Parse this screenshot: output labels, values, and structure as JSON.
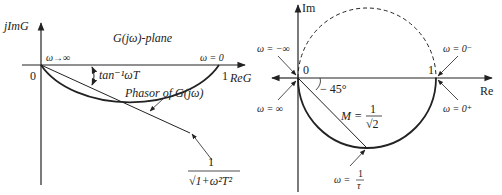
{
  "left_plot": {
    "y_axis_label": "jImG",
    "x_axis_label": "ReG",
    "plane_label": "G(jω)-plane",
    "origin_label": "0",
    "one_label": "1",
    "omega_inf_label": "ω→∞",
    "omega_zero_label": "ω = 0",
    "angle_label": "tan⁻¹ωT",
    "phasor_label": "Phasor of G(jω)",
    "magnitude_num": "1",
    "magnitude_den": "√1+ω²T²"
  },
  "right_plot": {
    "y_axis_label": "Im",
    "x_axis_label": "Re",
    "origin_label": "0",
    "one_label": "1",
    "omega_neg_inf": "ω = −∞",
    "omega_pos_inf": "ω = ∞",
    "omega_zero_minus": "ω = 0⁻",
    "omega_zero_plus": "ω = 0⁺",
    "angle_label": "− 45°",
    "M_label": "M =",
    "M_num": "1",
    "M_den": "√2",
    "omega_corner": "ω =",
    "omega_corner_num": "1",
    "omega_corner_den": "τ"
  }
}
